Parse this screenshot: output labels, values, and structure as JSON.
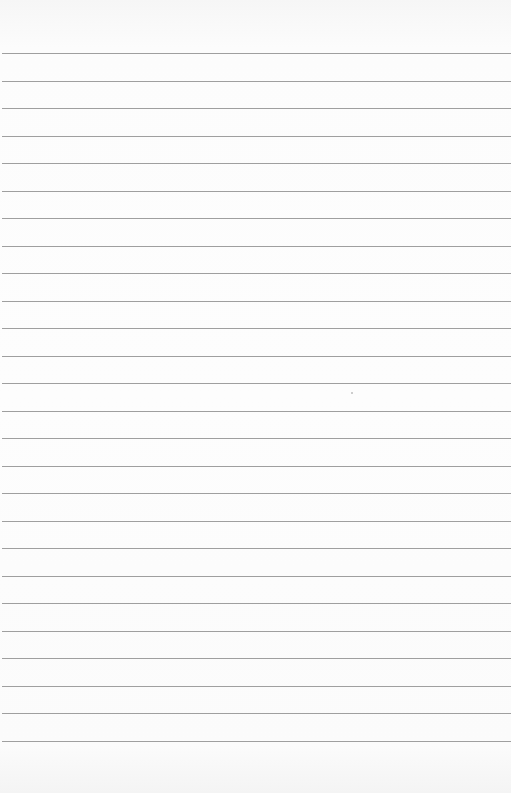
{
  "page": {
    "type": "blank lined paper",
    "background_color": "#fbfbfb",
    "rule_color": "#8e8e8e",
    "rule_count": 26,
    "first_rule_y": 53,
    "rule_spacing_px": 27.5,
    "text_content": ""
  }
}
